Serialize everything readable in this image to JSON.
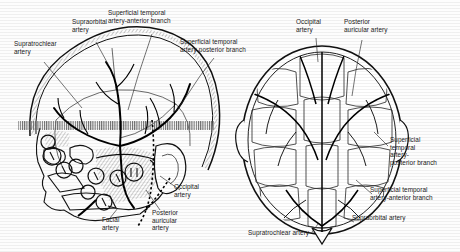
{
  "figure": {
    "panels": [
      {
        "name": "lateral-skull-view",
        "caption": ""
      },
      {
        "name": "superior-scalp-view",
        "caption": ""
      }
    ]
  },
  "labels": {
    "left_panel": [
      {
        "id": "supratrochlear",
        "text": "Supratrochlear\nartery",
        "x": 14,
        "y": 44
      },
      {
        "id": "supraorbital",
        "text": "Supraorbital\nartery",
        "x": 76,
        "y": 22
      },
      {
        "id": "st_anterior",
        "text": "Superficial temporal\nartery-anterior branch",
        "x": 110,
        "y": 12
      },
      {
        "id": "st_posterior",
        "text": "Superficial temporal\nartery-posterior branch",
        "x": 182,
        "y": 41
      },
      {
        "id": "occipital",
        "text": "Occipital\nartery",
        "x": 172,
        "y": 186
      },
      {
        "id": "post_auricular",
        "text": "Posterior\nauricular\nartery",
        "x": 155,
        "y": 214
      },
      {
        "id": "facial",
        "text": "Facial\nartery",
        "x": 104,
        "y": 221
      }
    ],
    "right_panel": [
      {
        "id": "occipital_top",
        "text": "Occipital\nartery",
        "x": 300,
        "y": 22
      },
      {
        "id": "post_auricular_top",
        "text": "Posterior\nauricular artery",
        "x": 348,
        "y": 22
      },
      {
        "id": "st_posterior_r",
        "text": "Superficial\ntemporal\nartery-\n    posterior branch",
        "x": 390,
        "y": 141
      },
      {
        "id": "st_anterior_r",
        "text": "Superficial temporal\nartery-anterior branch",
        "x": 372,
        "y": 190
      },
      {
        "id": "supraorbital_r",
        "text": "Supraorbital artery",
        "x": 355,
        "y": 218
      },
      {
        "id": "supratrochlear_r",
        "text": "Supratrochlear artery",
        "x": 250,
        "y": 233
      }
    ]
  },
  "colors": {
    "ink": "#1a1a1a",
    "vessel": "#0d0d0d",
    "hatch": "#555555",
    "paper": "#fdfdfd"
  }
}
